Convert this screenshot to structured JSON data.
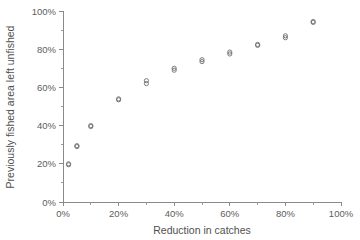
{
  "chart_data": {
    "type": "scatter",
    "title": "",
    "xlabel": "Reduction in catches",
    "ylabel": "Previously fished area left unfished",
    "xlim": [
      0,
      100
    ],
    "ylim": [
      0,
      100
    ],
    "xticks": [
      0,
      20,
      40,
      60,
      80,
      100
    ],
    "yticks": [
      0,
      20,
      40,
      60,
      80,
      100
    ],
    "xticklabels": [
      "0%",
      "20%",
      "40%",
      "60%",
      "80%",
      "100%"
    ],
    "yticklabels": [
      "0%",
      "20%",
      "40%",
      "60%",
      "80%",
      "100%"
    ],
    "x_minor_ticks": [
      10,
      30,
      50,
      70,
      90
    ],
    "y_minor_ticks": [
      10,
      30,
      50,
      70,
      90
    ],
    "grid": false,
    "legend": null,
    "marker": "open-circle",
    "marker_color": "#6e6e6e",
    "axis_color": "#8a8a8a",
    "text_color": "#5d5d5d",
    "background": "#ffffff",
    "series": [
      {
        "name": "series-a",
        "x": [
          2,
          5,
          10,
          20,
          30,
          40,
          50,
          60,
          70,
          80,
          90
        ],
        "values": [
          20,
          29.5,
          40,
          54,
          63.5,
          70,
          74.5,
          78.5,
          82.5,
          87,
          94.5
        ]
      },
      {
        "name": "series-b",
        "x": [
          2,
          5,
          10,
          20,
          30,
          40,
          50,
          60,
          70,
          80,
          90
        ],
        "values": [
          19.5,
          29,
          39.5,
          53.5,
          62,
          69,
          73.5,
          77.5,
          82,
          86,
          94
        ]
      }
    ]
  }
}
